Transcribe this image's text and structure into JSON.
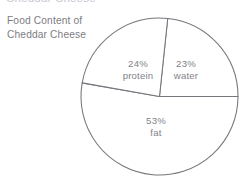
{
  "clipped_heading": {
    "text": "Cheddar Cheese"
  },
  "caption": {
    "line1": "Food Content of",
    "line2": "Cheddar Cheese"
  },
  "colors": {
    "background": "#ffffff",
    "slice_fill": "#ffffff",
    "slice_outline": "#76767c",
    "label_text": "#82828a",
    "caption_text": "#7d7d83",
    "clipped_heading_text": "#c9c9d2"
  },
  "chart_data": {
    "type": "pie",
    "title": "Food Content of Cheddar Cheese",
    "xlabel": "",
    "ylabel": "",
    "grid": false,
    "legend": "none",
    "labels_inside_slices": true,
    "total_percent": 100,
    "categories": [
      "water",
      "protein",
      "fat"
    ],
    "values": [
      23,
      24,
      53
    ],
    "slices": [
      {
        "name": "water",
        "value": 23,
        "percent_label": "23%",
        "name_label": "water",
        "start_angle_deg": -84,
        "end_angle_deg": 0,
        "sweep_deg": 84,
        "label_x": 186,
        "label_y": 64,
        "fill": "#ffffff"
      },
      {
        "name": "fat",
        "value": 53,
        "percent_label": "53%",
        "name_label": "fat",
        "start_angle_deg": 0,
        "end_angle_deg": 190,
        "sweep_deg": 190,
        "label_x": 156,
        "label_y": 121,
        "fill": "#ffffff"
      },
      {
        "name": "protein",
        "value": 24,
        "percent_label": "24%",
        "name_label": "protein",
        "start_angle_deg": 190,
        "end_angle_deg": 276,
        "sweep_deg": 86,
        "label_x": 138,
        "label_y": 64,
        "fill": "#ffffff"
      }
    ],
    "geometry": {
      "center_x": 159.5,
      "center_y": 96.5,
      "radius": 78.5
    }
  }
}
